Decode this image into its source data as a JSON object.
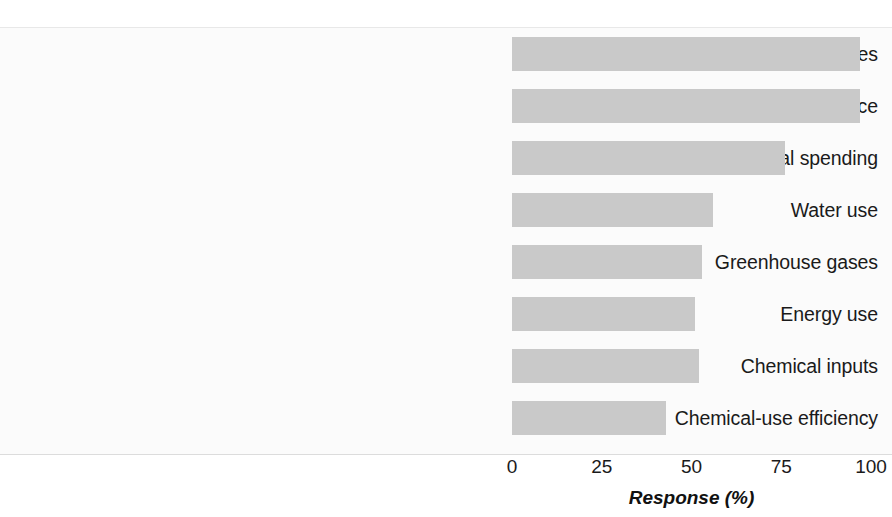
{
  "figure": {
    "cropped_header_sliver": "",
    "background_color": "#fbfbfb",
    "bar_color": "#c9c9c9",
    "text_color": "#1a1a1a"
  },
  "chart_data": {
    "type": "bar",
    "orientation": "horizontal",
    "title": "",
    "subtitle": "",
    "xlabel": "Response (%)",
    "ylabel": "",
    "xlim": [
      0,
      100
    ],
    "xticks": [
      0,
      25,
      50,
      75,
      100
    ],
    "xticklabels": [
      "0",
      "25",
      "50",
      "75",
      "100"
    ],
    "grid": false,
    "legend": null,
    "legend_position": "none",
    "categories": [
      "Chemical releases",
      "Regulatory compliance",
      "Environmental spending",
      "Water use",
      "Greenhouse gases",
      "Energy use",
      "Chemical inputs",
      "Chemical-use efficiency"
    ],
    "values": [
      97,
      97,
      76,
      56,
      53,
      51,
      52,
      43
    ],
    "series": [
      {
        "name": "Response (%)",
        "values": [
          97,
          97,
          76,
          56,
          53,
          51,
          52,
          43
        ]
      }
    ],
    "annotations": []
  }
}
